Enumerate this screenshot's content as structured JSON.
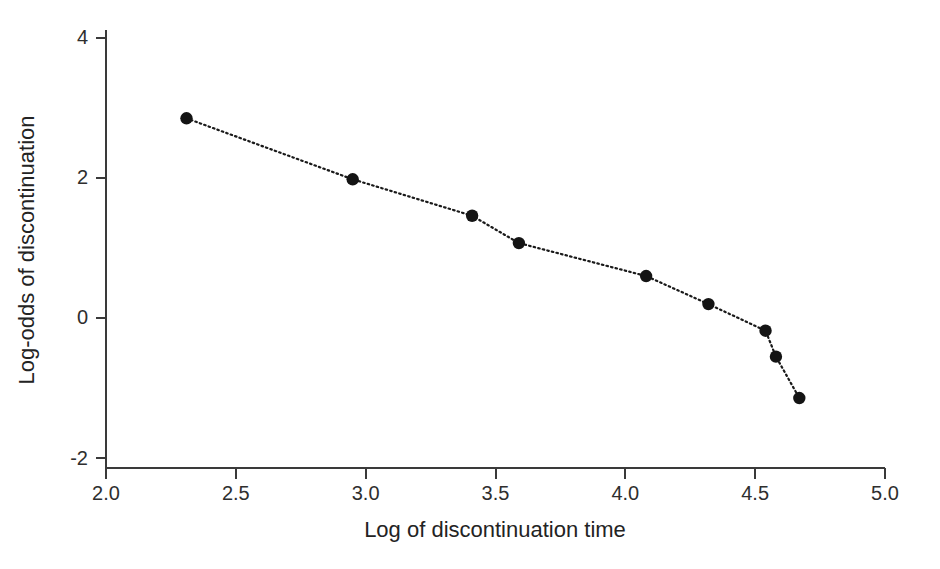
{
  "chart_data": {
    "type": "line",
    "title": "",
    "xlabel": "Log of discontinuation time",
    "ylabel": "Log-odds of discontinuation",
    "xlim": [
      2.0,
      5.0
    ],
    "ylim": [
      -2,
      4
    ],
    "xticks": [
      2.0,
      2.5,
      3.0,
      3.5,
      4.0,
      4.5,
      5.0
    ],
    "xtick_labels": [
      "2.0",
      "2.5",
      "3.0",
      "3.5",
      "4.0",
      "4.5",
      "5.0"
    ],
    "yticks": [
      -2,
      0,
      2,
      4
    ],
    "ytick_labels": [
      "-2",
      "0",
      "2",
      "4"
    ],
    "grid": false,
    "legend": null,
    "line_style": "dotted",
    "marker": "filled-circle",
    "series": [
      {
        "name": "log-odds of discontinuation",
        "color": "#141414",
        "points": [
          {
            "x": 2.31,
            "y": 2.85
          },
          {
            "x": 2.95,
            "y": 1.98
          },
          {
            "x": 3.41,
            "y": 1.46
          },
          {
            "x": 3.59,
            "y": 1.07
          },
          {
            "x": 4.08,
            "y": 0.6
          },
          {
            "x": 4.32,
            "y": 0.2
          },
          {
            "x": 4.54,
            "y": -0.18
          },
          {
            "x": 4.58,
            "y": -0.55
          },
          {
            "x": 4.67,
            "y": -1.14
          }
        ]
      }
    ]
  },
  "axes": {
    "x_title": "Log of discontinuation time",
    "y_title": "Log-odds of discontinuation"
  }
}
